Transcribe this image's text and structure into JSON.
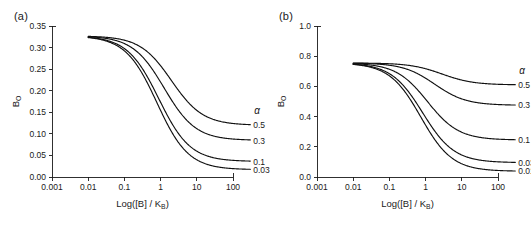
{
  "figure": {
    "background": "#ffffff",
    "curve_color": "#111111",
    "axis_color": "#1a1a1a"
  },
  "panels": [
    {
      "id": "a",
      "label": "(a)",
      "xaxis": {
        "title_prefix": "Log([B] / K",
        "title_sub": "B",
        "title_suffix": ")",
        "ticks": [
          "0.001",
          "0.01",
          "0.1",
          "1",
          "10",
          "100"
        ],
        "tick_values": [
          -3,
          -2,
          -1,
          0,
          1,
          2
        ],
        "range": [
          -3,
          2
        ],
        "scale": "log"
      },
      "yaxis": {
        "title_main": "B",
        "title_sub": "O",
        "ticks": [
          "0.00",
          "0.05",
          "0.10",
          "0.15",
          "0.20",
          "0.25",
          "0.30",
          "0.35"
        ],
        "tick_values": [
          0.0,
          0.05,
          0.1,
          0.15,
          0.2,
          0.25,
          0.3,
          0.35
        ],
        "range": [
          0.0,
          0.35
        ]
      },
      "legend_header": "α",
      "curves": [
        {
          "label": "0.5",
          "alpha": 0.5,
          "top": 0.327,
          "bottom": 0.12,
          "logEC50": 0.3,
          "hill": 1.0
        },
        {
          "label": "0.3",
          "alpha": 0.3,
          "top": 0.327,
          "bottom": 0.085,
          "logEC50": 0.1,
          "hill": 1.0
        },
        {
          "label": "0.1",
          "alpha": 0.1,
          "top": 0.327,
          "bottom": 0.036,
          "logEC50": -0.05,
          "hill": 1.0
        },
        {
          "label": "0.03",
          "alpha": 0.03,
          "top": 0.327,
          "bottom": 0.017,
          "logEC50": -0.1,
          "hill": 1.0
        }
      ]
    },
    {
      "id": "b",
      "label": "(b)",
      "xaxis": {
        "title_prefix": "Log([B] / K",
        "title_sub": "B",
        "title_suffix": ")",
        "ticks": [
          "0.001",
          "0.01",
          "0.1",
          "1",
          "10",
          "100"
        ],
        "tick_values": [
          -3,
          -2,
          -1,
          0,
          1,
          2
        ],
        "range": [
          -3,
          2
        ],
        "scale": "log"
      },
      "yaxis": {
        "title_main": "B",
        "title_sub": "O",
        "ticks": [
          "0.0",
          "0.2",
          "0.4",
          "0.6",
          "0.8",
          "1.0"
        ],
        "tick_values": [
          0.0,
          0.2,
          0.4,
          0.6,
          0.8,
          1.0
        ],
        "range": [
          0.0,
          1.0
        ]
      },
      "legend_header": "α",
      "curves": [
        {
          "label": "0.5",
          "alpha": 0.5,
          "top": 0.755,
          "bottom": 0.61,
          "logEC50": 0.45,
          "hill": 1.0
        },
        {
          "label": "0.3",
          "alpha": 0.3,
          "top": 0.755,
          "bottom": 0.475,
          "logEC50": 0.25,
          "hill": 1.0
        },
        {
          "label": "0.1",
          "alpha": 0.1,
          "top": 0.755,
          "bottom": 0.245,
          "logEC50": 0.05,
          "hill": 1.0
        },
        {
          "label": "0.03",
          "alpha": 0.03,
          "top": 0.755,
          "bottom": 0.095,
          "logEC50": -0.08,
          "hill": 1.0
        },
        {
          "label": "0.01",
          "alpha": 0.01,
          "top": 0.755,
          "bottom": 0.038,
          "logEC50": -0.13,
          "hill": 1.0
        }
      ]
    }
  ],
  "chart_data": [
    {
      "type": "line",
      "panel": "a",
      "title": "(a)",
      "xlabel": "Log([B] / K_B)",
      "ylabel": "B_O",
      "xscale": "log",
      "xlim": [
        0.001,
        100
      ],
      "ylim": [
        0.0,
        0.35
      ],
      "xticks": [
        0.001,
        0.01,
        0.1,
        1,
        10,
        100
      ],
      "xticklabels": [
        "0.001",
        "0.01",
        "0.1",
        "1",
        "10",
        "100"
      ],
      "yticks": [
        0.0,
        0.05,
        0.1,
        0.15,
        0.2,
        0.25,
        0.3,
        0.35
      ],
      "yticklabels": [
        "0.00",
        "0.05",
        "0.10",
        "0.15",
        "0.20",
        "0.25",
        "0.30",
        "0.35"
      ],
      "grid": false,
      "legend": "inline-right",
      "legend_title": "α",
      "curve_start_value": 0.327,
      "data_start_x": 0.01,
      "data_end_x": 300,
      "series": [
        {
          "name": "0.5",
          "x": [
            0.01,
            0.03,
            0.1,
            0.3,
            1,
            3,
            10,
            30,
            100,
            300
          ],
          "values": [
            0.327,
            0.326,
            0.32,
            0.3,
            0.246,
            0.178,
            0.136,
            0.124,
            0.121,
            0.12
          ]
        },
        {
          "name": "0.3",
          "x": [
            0.01,
            0.03,
            0.1,
            0.3,
            1,
            3,
            10,
            30,
            100,
            300
          ],
          "values": [
            0.327,
            0.326,
            0.318,
            0.292,
            0.225,
            0.145,
            0.1,
            0.089,
            0.086,
            0.085
          ]
        },
        {
          "name": "0.1",
          "x": [
            0.01,
            0.03,
            0.1,
            0.3,
            1,
            3,
            10,
            30,
            100,
            300
          ],
          "values": [
            0.327,
            0.325,
            0.315,
            0.281,
            0.199,
            0.097,
            0.051,
            0.04,
            0.037,
            0.036
          ]
        },
        {
          "name": "0.03",
          "x": [
            0.01,
            0.03,
            0.1,
            0.3,
            1,
            3,
            10,
            30,
            100,
            300
          ],
          "values": [
            0.327,
            0.325,
            0.314,
            0.277,
            0.19,
            0.082,
            0.033,
            0.021,
            0.018,
            0.017
          ]
        }
      ]
    },
    {
      "type": "line",
      "panel": "b",
      "title": "(b)",
      "xlabel": "Log([B] / K_B)",
      "ylabel": "B_O",
      "xscale": "log",
      "xlim": [
        0.001,
        100
      ],
      "ylim": [
        0.0,
        1.0
      ],
      "xticks": [
        0.001,
        0.01,
        0.1,
        1,
        10,
        100
      ],
      "xticklabels": [
        "0.001",
        "0.01",
        "0.1",
        "1",
        "10",
        "100"
      ],
      "yticks": [
        0.0,
        0.2,
        0.4,
        0.6,
        0.8,
        1.0
      ],
      "yticklabels": [
        "0.0",
        "0.2",
        "0.4",
        "0.6",
        "0.8",
        "1.0"
      ],
      "grid": false,
      "legend": "inline-right",
      "legend_title": "α",
      "curve_start_value": 0.755,
      "data_start_x": 0.01,
      "data_end_x": 300,
      "series": [
        {
          "name": "0.5",
          "x": [
            0.01,
            0.03,
            0.1,
            0.3,
            1,
            3,
            10,
            30,
            100,
            300
          ],
          "values": [
            0.755,
            0.754,
            0.75,
            0.737,
            0.703,
            0.655,
            0.622,
            0.613,
            0.611,
            0.61
          ]
        },
        {
          "name": "0.3",
          "x": [
            0.01,
            0.03,
            0.1,
            0.3,
            1,
            3,
            10,
            30,
            100,
            300
          ],
          "values": [
            0.755,
            0.754,
            0.748,
            0.728,
            0.675,
            0.57,
            0.498,
            0.48,
            0.476,
            0.475
          ]
        },
        {
          "name": "0.1",
          "x": [
            0.01,
            0.03,
            0.1,
            0.3,
            1,
            3,
            10,
            30,
            100,
            300
          ],
          "values": [
            0.755,
            0.753,
            0.744,
            0.713,
            0.613,
            0.406,
            0.281,
            0.253,
            0.247,
            0.245
          ]
        },
        {
          "name": "0.03",
          "x": [
            0.01,
            0.03,
            0.1,
            0.3,
            1,
            3,
            10,
            30,
            100,
            300
          ],
          "values": [
            0.755,
            0.752,
            0.741,
            0.702,
            0.576,
            0.294,
            0.133,
            0.102,
            0.096,
            0.095
          ]
        },
        {
          "name": "0.01",
          "x": [
            0.01,
            0.03,
            0.1,
            0.3,
            1,
            3,
            10,
            30,
            100,
            300
          ],
          "values": [
            0.755,
            0.752,
            0.74,
            0.699,
            0.565,
            0.259,
            0.079,
            0.045,
            0.039,
            0.038
          ]
        }
      ]
    }
  ]
}
